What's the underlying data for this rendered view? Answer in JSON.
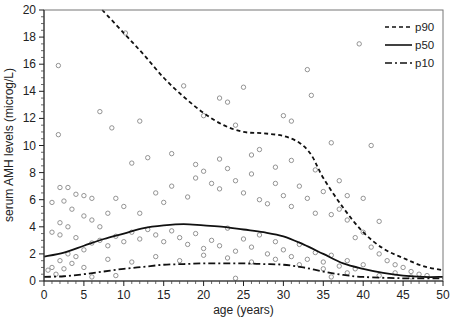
{
  "chart_data": {
    "type": "scatter",
    "title": "",
    "xlabel": "age (years)",
    "ylabel": "serum AMH levels (microg/L)",
    "xlim": [
      0,
      50
    ],
    "ylim": [
      0,
      20
    ],
    "x_ticks": [
      0,
      5,
      10,
      15,
      20,
      25,
      30,
      35,
      40,
      45,
      50
    ],
    "y_ticks": [
      0,
      2,
      4,
      6,
      8,
      10,
      12,
      14,
      16,
      18,
      20
    ],
    "grid": false,
    "legend_position": "top-right",
    "legend": [
      {
        "label": "p90",
        "style": "dashed"
      },
      {
        "label": "p50",
        "style": "solid"
      },
      {
        "label": "p10",
        "style": "dash-dot"
      }
    ],
    "series": [
      {
        "name": "p90",
        "style": "dashed",
        "x": [
          7.3,
          10,
          12.5,
          15,
          17.5,
          20,
          22.5,
          25,
          27.5,
          30,
          32,
          33.5,
          35,
          37.5,
          40,
          42.5,
          45,
          47.5,
          50
        ],
        "values": [
          20,
          18.3,
          16.7,
          15.0,
          13.6,
          12.4,
          11.5,
          11.0,
          10.9,
          10.7,
          10.2,
          9.3,
          7.6,
          5.4,
          3.6,
          2.4,
          1.7,
          1.1,
          0.8
        ]
      },
      {
        "name": "p50",
        "style": "solid",
        "x": [
          0,
          2.5,
          5,
          7.5,
          10,
          12.5,
          15,
          17.5,
          20,
          22.5,
          25,
          27.5,
          30,
          32.5,
          35,
          37.5,
          40,
          42.5,
          45,
          47.5,
          50
        ],
        "values": [
          1.8,
          2.1,
          2.6,
          3.1,
          3.5,
          3.9,
          4.1,
          4.2,
          4.1,
          4.0,
          3.8,
          3.6,
          3.3,
          2.7,
          2.0,
          1.3,
          0.9,
          0.6,
          0.4,
          0.3,
          0.3
        ]
      },
      {
        "name": "p10",
        "style": "dash-dot",
        "x": [
          0,
          2.5,
          5,
          7.5,
          10,
          12.5,
          15,
          17.5,
          20,
          22.5,
          25,
          27.5,
          30,
          32.5,
          35,
          37.5,
          40,
          45,
          50
        ],
        "values": [
          0.3,
          0.35,
          0.5,
          0.7,
          0.9,
          1.05,
          1.2,
          1.25,
          1.3,
          1.3,
          1.3,
          1.25,
          1.2,
          1.0,
          0.7,
          0.45,
          0.3,
          0.2,
          0.2
        ]
      },
      {
        "name": "observations",
        "style": "open-circle-markers",
        "points": [
          [
            1.8,
            15.9
          ],
          [
            1.8,
            10.8
          ],
          [
            10.2,
            18.3
          ],
          [
            39.5,
            17.5
          ],
          [
            33,
            15.6
          ],
          [
            17.5,
            14.4
          ],
          [
            33.5,
            13.7
          ],
          [
            25,
            14.3
          ],
          [
            22,
            13.5
          ],
          [
            23,
            13.2
          ],
          [
            12,
            11.8
          ],
          [
            7,
            12.5
          ],
          [
            8.5,
            11.3
          ],
          [
            20,
            12.2
          ],
          [
            24,
            11.5
          ],
          [
            30,
            12.2
          ],
          [
            31,
            11.8
          ],
          [
            27,
            9.7
          ],
          [
            36,
            10.2
          ],
          [
            41,
            10.0
          ],
          [
            2,
            6.9
          ],
          [
            3,
            6.9
          ],
          [
            1,
            5.8
          ],
          [
            2.5,
            5.9
          ],
          [
            4,
            6.4
          ],
          [
            5,
            6.3
          ],
          [
            6,
            6.1
          ],
          [
            3.5,
            5.3
          ],
          [
            5,
            4.8
          ],
          [
            6,
            4.5
          ],
          [
            2,
            4.3
          ],
          [
            3,
            4.0
          ],
          [
            1,
            3.6
          ],
          [
            2,
            3.4
          ],
          [
            4,
            3.2
          ],
          [
            7,
            4.0
          ],
          [
            8,
            5.0
          ],
          [
            9,
            6.1
          ],
          [
            10,
            5.5
          ],
          [
            12,
            5.0
          ],
          [
            14,
            6.5
          ],
          [
            15,
            5.8
          ],
          [
            16,
            7.0
          ],
          [
            18,
            6.2
          ],
          [
            19,
            7.6
          ],
          [
            20,
            8.1
          ],
          [
            21,
            7.2
          ],
          [
            22,
            6.8
          ],
          [
            23,
            8.3
          ],
          [
            24,
            7.4
          ],
          [
            25,
            6.5
          ],
          [
            26,
            7.9
          ],
          [
            27,
            6.0
          ],
          [
            28,
            5.7
          ],
          [
            29,
            7.2
          ],
          [
            30,
            6.3
          ],
          [
            31,
            5.5
          ],
          [
            32,
            7.0
          ],
          [
            33,
            6.1
          ],
          [
            34,
            5.0
          ],
          [
            35,
            6.6
          ],
          [
            36,
            4.9
          ],
          [
            37,
            5.3
          ],
          [
            38,
            4.5
          ],
          [
            39,
            3.2
          ],
          [
            40,
            3.6
          ],
          [
            41,
            2.5
          ],
          [
            42,
            2.0
          ],
          [
            43,
            1.5
          ],
          [
            44,
            1.2
          ],
          [
            45,
            1.0
          ],
          [
            46,
            0.7
          ],
          [
            47,
            0.5
          ],
          [
            48,
            0.4
          ],
          [
            1,
            1.0
          ],
          [
            2,
            1.5
          ],
          [
            3,
            2.0
          ],
          [
            4,
            1.8
          ],
          [
            5,
            2.3
          ],
          [
            6,
            2.8
          ],
          [
            7,
            3.0
          ],
          [
            8,
            2.6
          ],
          [
            9,
            3.3
          ],
          [
            10,
            2.9
          ],
          [
            11,
            3.6
          ],
          [
            12,
            3.1
          ],
          [
            13,
            3.8
          ],
          [
            14,
            3.4
          ],
          [
            15,
            2.9
          ],
          [
            16,
            3.7
          ],
          [
            17,
            3.2
          ],
          [
            18,
            2.7
          ],
          [
            19,
            3.5
          ],
          [
            20,
            2.4
          ],
          [
            21,
            3.0
          ],
          [
            22,
            2.6
          ],
          [
            23,
            3.9
          ],
          [
            24,
            2.2
          ],
          [
            25,
            3.1
          ],
          [
            26,
            2.5
          ],
          [
            27,
            3.4
          ],
          [
            28,
            2.0
          ],
          [
            29,
            2.9
          ],
          [
            30,
            2.3
          ],
          [
            31,
            1.8
          ],
          [
            32,
            2.7
          ],
          [
            33,
            1.6
          ],
          [
            34,
            2.1
          ],
          [
            35,
            1.4
          ],
          [
            36,
            1.9
          ],
          [
            37,
            1.1
          ],
          [
            38,
            1.5
          ],
          [
            39,
            0.9
          ],
          [
            40,
            1.2
          ],
          [
            0.5,
            0.8
          ],
          [
            1.5,
            0.5
          ],
          [
            2.5,
            0.9
          ],
          [
            3.5,
            1.3
          ],
          [
            5,
            1.0
          ],
          [
            8,
            1.6
          ],
          [
            11,
            1.4
          ],
          [
            14,
            1.8
          ],
          [
            17,
            1.5
          ],
          [
            20,
            1.9
          ],
          [
            23,
            1.7
          ],
          [
            26,
            1.4
          ],
          [
            29,
            1.6
          ],
          [
            32,
            1.2
          ],
          [
            35,
            0.9
          ],
          [
            38,
            0.6
          ],
          [
            6,
            0.3
          ],
          [
            9,
            0.4
          ],
          [
            24,
            0.2
          ],
          [
            36,
            0.3
          ],
          [
            42,
            0.4
          ],
          [
            44,
            0.6
          ],
          [
            46,
            0.3
          ],
          [
            11,
            8.7
          ],
          [
            13,
            9.1
          ],
          [
            16,
            9.4
          ],
          [
            19,
            8.6
          ],
          [
            22,
            9.0
          ],
          [
            26,
            9.3
          ],
          [
            29,
            8.4
          ],
          [
            31,
            8.9
          ],
          [
            34,
            8.2
          ],
          [
            37,
            7.4
          ],
          [
            38,
            6.3
          ],
          [
            40,
            6.1
          ],
          [
            42,
            4.4
          ]
        ]
      }
    ]
  }
}
